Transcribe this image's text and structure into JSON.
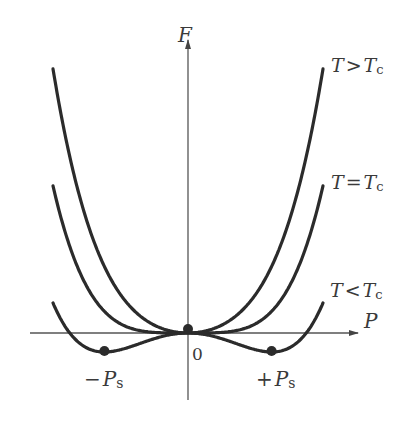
{
  "chart_data": {
    "type": "line",
    "xlabel": "P",
    "ylabel": "F",
    "origin_label": "0",
    "grid": false,
    "series": [
      {
        "name": "T>Tc",
        "label_main": "T",
        "label_rel": ">",
        "label_sub_base": "T",
        "label_sub": "c",
        "a": 0.00642,
        "b": 4.43e-07
      },
      {
        "name": "T=Tc",
        "label_main": "T",
        "label_rel": "=",
        "label_sub_base": "T",
        "label_sub": "c",
        "a": 0.0,
        "b": 4.43e-07
      },
      {
        "name": "T<Tc",
        "label_main": "T",
        "label_rel": "<",
        "label_sub_base": "T",
        "label_sub": "c",
        "a": -0.00544,
        "b": 3.89e-07
      }
    ],
    "minima": [
      {
        "label_sign": "−",
        "label_base": "P",
        "label_sub": "s",
        "x": -85
      },
      {
        "label_sign": "+",
        "label_base": "P",
        "label_sub": "s",
        "x": 85
      }
    ],
    "origin_point": {
      "x": 0,
      "y": 0
    },
    "x_range": [
      -135,
      135
    ],
    "line_color": "#2b2b2b",
    "axis_color": "#555555"
  }
}
